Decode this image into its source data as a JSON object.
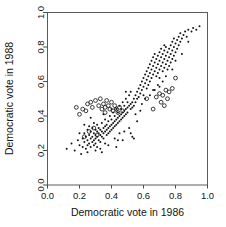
{
  "chart_data": {
    "type": "scatter",
    "title": "",
    "xlabel": "Democratic vote in 1986",
    "ylabel": "Democratic vote in 1988",
    "xlim": [
      0.0,
      1.0
    ],
    "ylim": [
      0.0,
      1.0
    ],
    "xticks": [
      "0.0",
      "0.2",
      "0.4",
      "0.6",
      "0.8",
      "1.0"
    ],
    "yticks": [
      "0.0",
      "0.2",
      "0.4",
      "0.6",
      "0.8",
      "1.0"
    ],
    "xtick_values": [
      0.0,
      0.2,
      0.4,
      0.6,
      0.8,
      1.0
    ],
    "ytick_values": [
      0.0,
      0.2,
      0.4,
      0.6,
      0.8,
      1.0
    ],
    "grid": false,
    "legend": null,
    "series": [
      {
        "name": "contested",
        "marker": "filled-dot",
        "color": "#121212",
        "points": [
          [
            0.12,
            0.21
          ],
          [
            0.15,
            0.24
          ],
          [
            0.17,
            0.2
          ],
          [
            0.19,
            0.26
          ],
          [
            0.2,
            0.23
          ],
          [
            0.21,
            0.18
          ],
          [
            0.22,
            0.27
          ],
          [
            0.22,
            0.22
          ],
          [
            0.23,
            0.3
          ],
          [
            0.23,
            0.25
          ],
          [
            0.24,
            0.21
          ],
          [
            0.24,
            0.28
          ],
          [
            0.25,
            0.32
          ],
          [
            0.25,
            0.26
          ],
          [
            0.25,
            0.23
          ],
          [
            0.26,
            0.29
          ],
          [
            0.26,
            0.24
          ],
          [
            0.26,
            0.34
          ],
          [
            0.27,
            0.27
          ],
          [
            0.27,
            0.31
          ],
          [
            0.27,
            0.22
          ],
          [
            0.28,
            0.28
          ],
          [
            0.28,
            0.25
          ],
          [
            0.28,
            0.33
          ],
          [
            0.29,
            0.3
          ],
          [
            0.29,
            0.26
          ],
          [
            0.29,
            0.23
          ],
          [
            0.3,
            0.29
          ],
          [
            0.3,
            0.32
          ],
          [
            0.3,
            0.27
          ],
          [
            0.3,
            0.24
          ],
          [
            0.31,
            0.31
          ],
          [
            0.31,
            0.28
          ],
          [
            0.31,
            0.35
          ],
          [
            0.32,
            0.3
          ],
          [
            0.32,
            0.26
          ],
          [
            0.32,
            0.33
          ],
          [
            0.33,
            0.29
          ],
          [
            0.33,
            0.32
          ],
          [
            0.33,
            0.25
          ],
          [
            0.34,
            0.31
          ],
          [
            0.34,
            0.28
          ],
          [
            0.34,
            0.36
          ],
          [
            0.35,
            0.33
          ],
          [
            0.35,
            0.3
          ],
          [
            0.35,
            0.27
          ],
          [
            0.36,
            0.34
          ],
          [
            0.36,
            0.31
          ],
          [
            0.36,
            0.38
          ],
          [
            0.37,
            0.32
          ],
          [
            0.37,
            0.29
          ],
          [
            0.37,
            0.35
          ],
          [
            0.38,
            0.33
          ],
          [
            0.38,
            0.3
          ],
          [
            0.38,
            0.37
          ],
          [
            0.39,
            0.34
          ],
          [
            0.39,
            0.31
          ],
          [
            0.39,
            0.4
          ],
          [
            0.4,
            0.35
          ],
          [
            0.4,
            0.32
          ],
          [
            0.4,
            0.38
          ],
          [
            0.41,
            0.36
          ],
          [
            0.41,
            0.33
          ],
          [
            0.41,
            0.42
          ],
          [
            0.42,
            0.37
          ],
          [
            0.42,
            0.34
          ],
          [
            0.42,
            0.4
          ],
          [
            0.43,
            0.38
          ],
          [
            0.43,
            0.35
          ],
          [
            0.43,
            0.44
          ],
          [
            0.44,
            0.39
          ],
          [
            0.44,
            0.36
          ],
          [
            0.44,
            0.42
          ],
          [
            0.45,
            0.4
          ],
          [
            0.45,
            0.37
          ],
          [
            0.45,
            0.46
          ],
          [
            0.46,
            0.41
          ],
          [
            0.46,
            0.38
          ],
          [
            0.46,
            0.44
          ],
          [
            0.47,
            0.42
          ],
          [
            0.47,
            0.39
          ],
          [
            0.47,
            0.48
          ],
          [
            0.48,
            0.43
          ],
          [
            0.48,
            0.4
          ],
          [
            0.48,
            0.46
          ],
          [
            0.49,
            0.44
          ],
          [
            0.49,
            0.41
          ],
          [
            0.49,
            0.5
          ],
          [
            0.5,
            0.45
          ],
          [
            0.5,
            0.42
          ],
          [
            0.5,
            0.48
          ],
          [
            0.51,
            0.46
          ],
          [
            0.51,
            0.52
          ],
          [
            0.52,
            0.47
          ],
          [
            0.52,
            0.44
          ],
          [
            0.52,
            0.54
          ],
          [
            0.53,
            0.48
          ],
          [
            0.53,
            0.45
          ],
          [
            0.53,
            0.28
          ],
          [
            0.54,
            0.5
          ],
          [
            0.54,
            0.46
          ],
          [
            0.54,
            0.27
          ],
          [
            0.55,
            0.52
          ],
          [
            0.55,
            0.48
          ],
          [
            0.56,
            0.54
          ],
          [
            0.56,
            0.5
          ],
          [
            0.57,
            0.56
          ],
          [
            0.57,
            0.51
          ],
          [
            0.58,
            0.58
          ],
          [
            0.58,
            0.53
          ],
          [
            0.58,
            0.43
          ],
          [
            0.59,
            0.6
          ],
          [
            0.59,
            0.55
          ],
          [
            0.6,
            0.62
          ],
          [
            0.6,
            0.57
          ],
          [
            0.6,
            0.52
          ],
          [
            0.61,
            0.64
          ],
          [
            0.61,
            0.59
          ],
          [
            0.62,
            0.66
          ],
          [
            0.62,
            0.61
          ],
          [
            0.62,
            0.56
          ],
          [
            0.63,
            0.68
          ],
          [
            0.63,
            0.63
          ],
          [
            0.63,
            0.58
          ],
          [
            0.64,
            0.7
          ],
          [
            0.64,
            0.65
          ],
          [
            0.64,
            0.6
          ],
          [
            0.65,
            0.72
          ],
          [
            0.65,
            0.67
          ],
          [
            0.65,
            0.62
          ],
          [
            0.66,
            0.74
          ],
          [
            0.66,
            0.69
          ],
          [
            0.66,
            0.64
          ],
          [
            0.67,
            0.71
          ],
          [
            0.67,
            0.66
          ],
          [
            0.67,
            0.76
          ],
          [
            0.68,
            0.73
          ],
          [
            0.68,
            0.68
          ],
          [
            0.68,
            0.63
          ],
          [
            0.69,
            0.75
          ],
          [
            0.69,
            0.7
          ],
          [
            0.69,
            0.65
          ],
          [
            0.7,
            0.77
          ],
          [
            0.7,
            0.72
          ],
          [
            0.7,
            0.67
          ],
          [
            0.7,
            0.62
          ],
          [
            0.71,
            0.74
          ],
          [
            0.71,
            0.69
          ],
          [
            0.71,
            0.79
          ],
          [
            0.72,
            0.76
          ],
          [
            0.72,
            0.71
          ],
          [
            0.72,
            0.66
          ],
          [
            0.73,
            0.78
          ],
          [
            0.73,
            0.73
          ],
          [
            0.73,
            0.68
          ],
          [
            0.73,
            0.81
          ],
          [
            0.74,
            0.75
          ],
          [
            0.74,
            0.7
          ],
          [
            0.74,
            0.8
          ],
          [
            0.75,
            0.77
          ],
          [
            0.75,
            0.72
          ],
          [
            0.75,
            0.67
          ],
          [
            0.76,
            0.79
          ],
          [
            0.76,
            0.74
          ],
          [
            0.76,
            0.69
          ],
          [
            0.77,
            0.81
          ],
          [
            0.77,
            0.76
          ],
          [
            0.77,
            0.71
          ],
          [
            0.78,
            0.83
          ],
          [
            0.78,
            0.78
          ],
          [
            0.78,
            0.73
          ],
          [
            0.79,
            0.8
          ],
          [
            0.79,
            0.75
          ],
          [
            0.79,
            0.85
          ],
          [
            0.8,
            0.82
          ],
          [
            0.8,
            0.77
          ],
          [
            0.8,
            0.72
          ],
          [
            0.81,
            0.84
          ],
          [
            0.81,
            0.79
          ],
          [
            0.82,
            0.86
          ],
          [
            0.82,
            0.81
          ],
          [
            0.83,
            0.83
          ],
          [
            0.83,
            0.88
          ],
          [
            0.84,
            0.85
          ],
          [
            0.85,
            0.87
          ],
          [
            0.86,
            0.89
          ],
          [
            0.87,
            0.86
          ],
          [
            0.88,
            0.9
          ],
          [
            0.9,
            0.89
          ],
          [
            0.91,
            0.91
          ],
          [
            0.93,
            0.9
          ],
          [
            0.95,
            0.92
          ],
          [
            0.56,
            0.37
          ],
          [
            0.45,
            0.3
          ],
          [
            0.33,
            0.21
          ],
          [
            0.36,
            0.24
          ],
          [
            0.42,
            0.27
          ],
          [
            0.48,
            0.31
          ],
          [
            0.51,
            0.33
          ],
          [
            0.25,
            0.19
          ],
          [
            0.3,
            0.2
          ],
          [
            0.38,
            0.23
          ],
          [
            0.44,
            0.26
          ],
          [
            0.29,
            0.36
          ],
          [
            0.35,
            0.41
          ],
          [
            0.4,
            0.44
          ],
          [
            0.49,
            0.54
          ],
          [
            0.55,
            0.41
          ],
          [
            0.61,
            0.5
          ],
          [
            0.66,
            0.55
          ],
          [
            0.72,
            0.6
          ],
          [
            0.78,
            0.67
          ],
          [
            0.84,
            0.76
          ],
          [
            0.88,
            0.83
          ],
          [
            0.67,
            0.55
          ],
          [
            0.7,
            0.57
          ],
          [
            0.74,
            0.63
          ],
          [
            0.2,
            0.3
          ],
          [
            0.23,
            0.35
          ],
          [
            0.27,
            0.39
          ],
          [
            0.31,
            0.22
          ],
          [
            0.34,
            0.19
          ],
          [
            0.43,
            0.22
          ],
          [
            0.47,
            0.26
          ],
          [
            0.52,
            0.3
          ],
          [
            0.59,
            0.47
          ],
          [
            0.64,
            0.52
          ],
          [
            0.69,
            0.58
          ]
        ]
      },
      {
        "name": "uncontested",
        "marker": "open-circle",
        "color": "#1a1a1a",
        "points": [
          [
            0.18,
            0.45
          ],
          [
            0.22,
            0.44
          ],
          [
            0.24,
            0.43
          ],
          [
            0.25,
            0.47
          ],
          [
            0.27,
            0.48
          ],
          [
            0.28,
            0.45
          ],
          [
            0.3,
            0.49
          ],
          [
            0.32,
            0.46
          ],
          [
            0.33,
            0.5
          ],
          [
            0.34,
            0.44
          ],
          [
            0.35,
            0.47
          ],
          [
            0.36,
            0.45
          ],
          [
            0.37,
            0.49
          ],
          [
            0.38,
            0.46
          ],
          [
            0.39,
            0.44
          ],
          [
            0.4,
            0.48
          ],
          [
            0.41,
            0.43
          ],
          [
            0.42,
            0.46
          ],
          [
            0.43,
            0.44
          ],
          [
            0.44,
            0.42
          ],
          [
            0.26,
            0.31
          ],
          [
            0.29,
            0.33
          ],
          [
            0.31,
            0.29
          ],
          [
            0.23,
            0.28
          ],
          [
            0.45,
            0.45
          ],
          [
            0.47,
            0.43
          ],
          [
            0.62,
            0.5
          ],
          [
            0.66,
            0.44
          ],
          [
            0.7,
            0.53
          ],
          [
            0.72,
            0.52
          ],
          [
            0.74,
            0.55
          ],
          [
            0.75,
            0.5
          ],
          [
            0.76,
            0.54
          ],
          [
            0.78,
            0.56
          ],
          [
            0.8,
            0.62
          ],
          [
            0.71,
            0.48
          ],
          [
            0.73,
            0.46
          ],
          [
            0.68,
            0.51
          ],
          [
            0.36,
            0.42
          ],
          [
            0.2,
            0.41
          ]
        ]
      }
    ]
  }
}
